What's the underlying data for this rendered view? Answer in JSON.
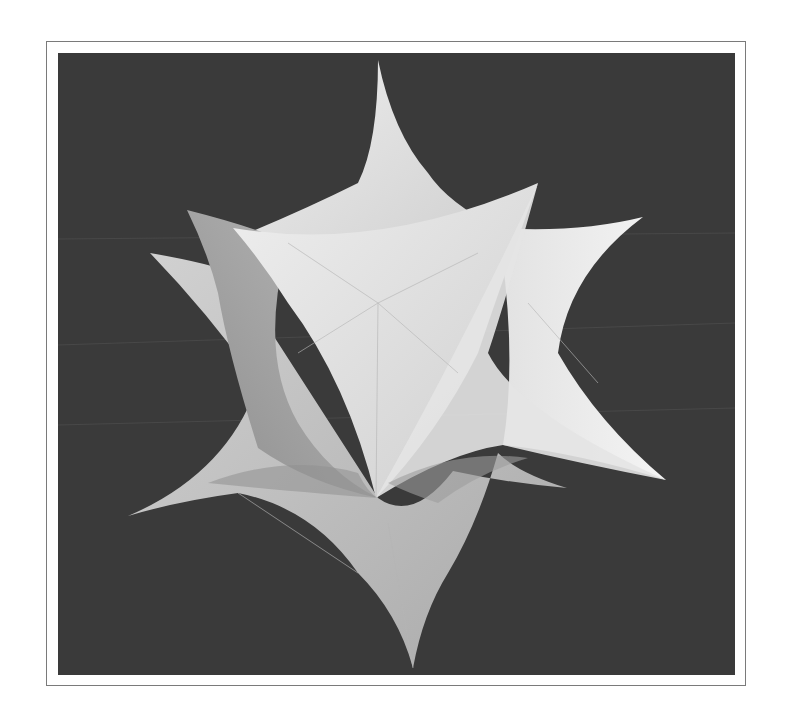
{
  "figure": {
    "colors": {
      "page_background": "#ffffff",
      "frame_border": "#7a7a7a",
      "viewport_background": "#3a3a3a",
      "surface_light": "#e6e6e6",
      "surface_mid": "#c4c4c4",
      "surface_dark": "#9a9a9a"
    },
    "spike_tips": [
      {
        "name": "top",
        "x": 320,
        "y": 7
      },
      {
        "name": "upper-left",
        "x": 129,
        "y": 157
      },
      {
        "name": "left",
        "x": 92,
        "y": 200
      },
      {
        "name": "upper-right-front",
        "x": 480,
        "y": 130
      },
      {
        "name": "right",
        "x": 585,
        "y": 164
      },
      {
        "name": "lower-left",
        "x": 70,
        "y": 463
      },
      {
        "name": "lower-right",
        "x": 608,
        "y": 427
      },
      {
        "name": "lower-right-small",
        "x": 509,
        "y": 435
      },
      {
        "name": "bottom",
        "x": 355,
        "y": 615
      },
      {
        "name": "front-center",
        "x": 315,
        "y": 445
      }
    ]
  }
}
